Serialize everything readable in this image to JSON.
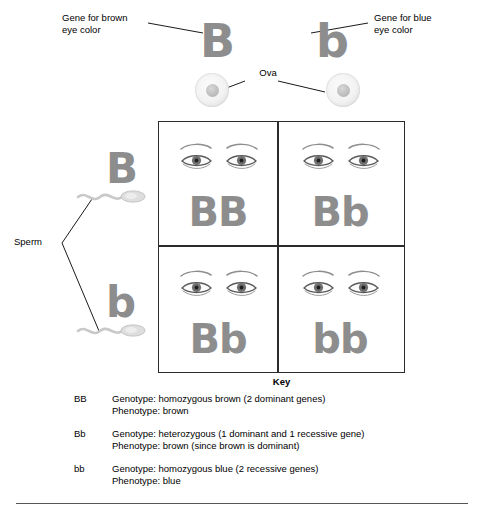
{
  "diagram": {
    "allele_color": "#8d8d8d"
  },
  "callouts": {
    "brown_gene": "Gene for brown\neye color",
    "blue_gene": "Gene for blue\neye color",
    "ova": "Ova",
    "sperm": "Sperm"
  },
  "parents": {
    "ova_alleles": [
      "B",
      "b"
    ]
  },
  "sperm": {
    "alleles": [
      "B",
      "b"
    ]
  },
  "punnett": {
    "cells": [
      {
        "genotype": "BB",
        "row": 0,
        "col": 0
      },
      {
        "genotype": "Bb",
        "row": 0,
        "col": 1
      },
      {
        "genotype": "Bb",
        "row": 1,
        "col": 0
      },
      {
        "genotype": "bb",
        "row": 1,
        "col": 1
      }
    ]
  },
  "key": {
    "title": "Key",
    "entries": [
      {
        "code": "BB",
        "description": "Genotype: homozygous brown (2 dominant genes)\nPhenotype: brown"
      },
      {
        "code": "Bb",
        "description": "Genotype: heterozygous (1 dominant and 1 recessive gene)\nPhenotype: brown (since brown is dominant)"
      },
      {
        "code": "bb",
        "description": "Genotype: homozygous blue (2 recessive genes)\nPhenotype: blue"
      }
    ]
  }
}
